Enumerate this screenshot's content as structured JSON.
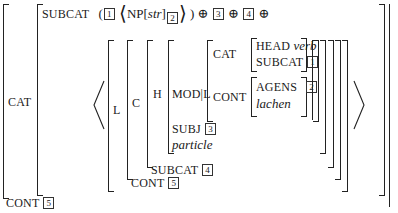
{
  "avm": {
    "outer_cat_label": "CAT",
    "outer_cont_label": "CONT",
    "outer_cont_tag": "5",
    "subcat": {
      "label": "SUBCAT",
      "open": "(",
      "tag1": "1",
      "np": "NP[",
      "np_case": "str",
      "np_close": "]",
      "np_tag": "2",
      "close": ")",
      "oplus1": "⊕",
      "tag3": "3",
      "oplus2": "⊕",
      "tag4": "4",
      "oplus3": "⊕"
    },
    "list": {
      "l_label": "L",
      "c_label": "C",
      "h_label": "H",
      "mod_label": "MOD|L",
      "inner_cat_label": "CAT",
      "head_label": "HEAD",
      "head_value": "verb",
      "inner_subcat_label": "SUBCAT",
      "inner_subcat_tag": "1",
      "inner_cont_label": "CONT",
      "agens_label": "AGENS",
      "agens_tag": "2",
      "relation": "lachen",
      "subj_label": "SUBJ",
      "subj_tag": "3",
      "type": "particle",
      "h_subcat_label": "SUBCAT",
      "h_subcat_tag": "4",
      "c_cont_label": "CONT",
      "c_cont_tag": "5"
    }
  }
}
